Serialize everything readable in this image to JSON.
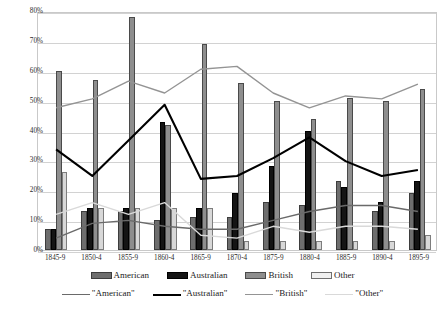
{
  "chart_data": {
    "type": "bar",
    "title": "",
    "subtitle": "",
    "xlabel": "",
    "ylabel": "",
    "ylim": [
      0,
      80
    ],
    "y_tick_labels": [
      "0%",
      "10%",
      "20%",
      "30%",
      "40%",
      "50%",
      "60%",
      "70%",
      "80%"
    ],
    "y_tick_values": [
      0,
      10,
      20,
      30,
      40,
      50,
      60,
      70,
      80
    ],
    "grid": true,
    "legend_position": "bottom",
    "categories": [
      "1845-9",
      "1850-4",
      "1855-9",
      "1860-4",
      "1865-9",
      "1870-4",
      "1875-9",
      "1880-4",
      "1885-9",
      "1890-4",
      "1895-9"
    ],
    "series": [
      {
        "name": "American",
        "kind": "bar",
        "color": "#6e6e6e",
        "values": [
          7,
          13,
          13,
          10,
          11,
          11,
          16,
          15,
          23,
          13,
          19
        ]
      },
      {
        "name": "Australian",
        "kind": "bar",
        "color": "#141414",
        "values": [
          7,
          14,
          14,
          43,
          14,
          19,
          28,
          40,
          21,
          16,
          23
        ]
      },
      {
        "name": "British",
        "kind": "bar",
        "color": "#8e8e8e",
        "values": [
          60,
          57,
          78,
          42,
          69,
          56,
          50,
          44,
          51,
          50,
          54
        ]
      },
      {
        "name": "Other",
        "kind": "bar",
        "color": "#d8d8d8",
        "values": [
          26,
          14,
          14,
          14,
          14,
          3,
          3,
          3,
          3,
          3,
          5
        ]
      },
      {
        "name": "\"American\"",
        "kind": "line",
        "color": "#6a6a6a",
        "values": [
          4,
          9,
          10,
          8,
          7,
          7,
          10,
          13,
          15,
          15,
          13
        ]
      },
      {
        "name": "\"Australian\"",
        "kind": "line",
        "color": "#000000",
        "values": [
          34,
          25,
          37,
          49,
          24,
          25,
          31,
          38,
          30,
          25,
          27
        ]
      },
      {
        "name": "\"British\"",
        "kind": "line",
        "color": "#949494",
        "values": [
          48,
          51,
          57,
          53,
          61,
          62,
          53,
          48,
          52,
          51,
          56
        ]
      },
      {
        "name": "\"Other\"",
        "kind": "line",
        "color": "#d9d9d9",
        "values": [
          12,
          16,
          12,
          16,
          5,
          4,
          8,
          6,
          8,
          8,
          7
        ]
      }
    ]
  },
  "axes": {
    "y_ticks": [
      "80%",
      "70%",
      "60%",
      "50%",
      "40%",
      "30%",
      "20%",
      "10%",
      "0%"
    ],
    "x_ticks": [
      "1845-9",
      "1850-4",
      "1855-9",
      "1860-4",
      "1865-9",
      "1870-4",
      "1875-9",
      "1880-4",
      "1885-9",
      "1890-4",
      "1895-9"
    ]
  },
  "legend": {
    "bars": [
      {
        "label": "American",
        "swatch": "american"
      },
      {
        "label": "Australian",
        "swatch": "australian"
      },
      {
        "label": "British",
        "swatch": "british"
      },
      {
        "label": "Other",
        "swatch": "other"
      }
    ],
    "lines": [
      {
        "label": "\"American\"",
        "swatch": "american"
      },
      {
        "label": "\"Australian\"",
        "swatch": "australian"
      },
      {
        "label": "\"British\"",
        "swatch": "british"
      },
      {
        "label": "\"Other\"",
        "swatch": "other"
      }
    ]
  }
}
